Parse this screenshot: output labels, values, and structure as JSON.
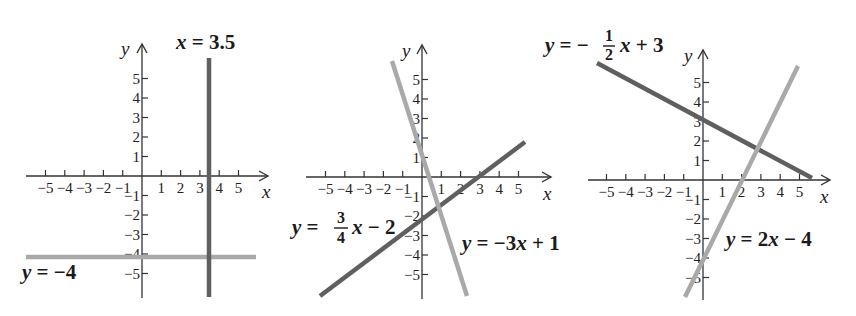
{
  "colors": {
    "dark_line": "#5f5f5f",
    "light_line": "#a9a9a9",
    "axis": "#333333"
  },
  "panels": [
    {
      "id": "graph-1",
      "axis_labels": {
        "x": "x",
        "y": "y"
      },
      "x_ticks": [
        "−5",
        "−4",
        "−3",
        "−2",
        "−1",
        "1",
        "2",
        "3",
        "4",
        "5"
      ],
      "y_ticks": [
        "5",
        "4",
        "3",
        "2",
        "1",
        "−1",
        "−2",
        "−3",
        "−4",
        "−5"
      ],
      "lines": [
        {
          "equation": "x = 3.5",
          "shade": "dark"
        },
        {
          "equation": "y = −4",
          "shade": "light"
        }
      ],
      "labels": {
        "line_a": "x = 3.5",
        "line_b": "y = −4"
      }
    },
    {
      "id": "graph-2",
      "axis_labels": {
        "x": "x",
        "y": "y"
      },
      "x_ticks": [
        "−5",
        "−4",
        "−3",
        "−2",
        "−1",
        "1",
        "2",
        "3",
        "4",
        "5"
      ],
      "y_ticks": [
        "5",
        "4",
        "3",
        "2",
        "1",
        "−1",
        "−2",
        "−3",
        "−4",
        "−5"
      ],
      "lines": [
        {
          "equation": "y = (3/4)x − 2",
          "shade": "dark"
        },
        {
          "equation": "y = −3x + 1",
          "shade": "light"
        }
      ],
      "labels": {
        "line_a_prefix": "y =",
        "line_a_num": "3",
        "line_a_den": "4",
        "line_a_suffix": "x − 2",
        "line_b": "y = −3x + 1"
      }
    },
    {
      "id": "graph-3",
      "axis_labels": {
        "x": "x",
        "y": "y"
      },
      "x_ticks": [
        "−5",
        "−4",
        "−3",
        "−2",
        "−1",
        "1",
        "2",
        "3",
        "4",
        "5"
      ],
      "y_ticks": [
        "5",
        "4",
        "3",
        "2",
        "1",
        "−1",
        "−2",
        "−3",
        "−4",
        "−5"
      ],
      "lines": [
        {
          "equation": "y = −(1/2)x + 3",
          "shade": "dark"
        },
        {
          "equation": "y = 2x − 4",
          "shade": "light"
        }
      ],
      "labels": {
        "line_a_prefix": "y = −",
        "line_a_num": "1",
        "line_a_den": "2",
        "line_a_suffix": "x + 3",
        "line_b": "y = 2x − 4"
      }
    }
  ]
}
